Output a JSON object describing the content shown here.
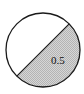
{
  "diagram": {
    "type": "circle-fraction",
    "shaded_label": "0.5",
    "shaded_fraction": 0.5,
    "colors": {
      "outline": "#1a1a1a",
      "shaded_fill": "#c8c8c8",
      "unshaded_fill": "#ffffff"
    }
  }
}
